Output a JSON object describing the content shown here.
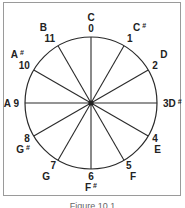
{
  "diagram": {
    "type": "pitch-class-circle",
    "center": [
      91,
      103
    ],
    "radius": 66,
    "stroke_color": "#2a2a2a",
    "positions": [
      {
        "number": "0",
        "note": "C",
        "sharp": false
      },
      {
        "number": "1",
        "note": "C",
        "sharp": true
      },
      {
        "number": "2",
        "note": "D",
        "sharp": false
      },
      {
        "number": "3",
        "note": "D",
        "sharp": true
      },
      {
        "number": "4",
        "note": "E",
        "sharp": false
      },
      {
        "number": "5",
        "note": "F",
        "sharp": false
      },
      {
        "number": "6",
        "note": "F",
        "sharp": true
      },
      {
        "number": "7",
        "note": "G",
        "sharp": false
      },
      {
        "number": "8",
        "note": "G",
        "sharp": true
      },
      {
        "number": "9",
        "note": "A",
        "sharp": false
      },
      {
        "number": "10",
        "note": "A",
        "sharp": true
      },
      {
        "number": "11",
        "note": "B",
        "sharp": false
      }
    ],
    "sharp_symbol": "#"
  },
  "caption": "Figure 10.1"
}
